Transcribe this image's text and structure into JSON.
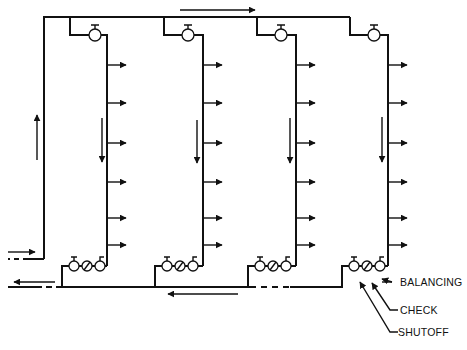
{
  "diagram": {
    "type": "hydronic-reverse-return-riser-schematic",
    "colors": {
      "line": "#111111",
      "background": "#ffffff"
    },
    "supply_header": {
      "y": 17,
      "x_start": 44,
      "x_end": 350
    },
    "left_supply_riser": {
      "x": 44,
      "y_top": 17,
      "y_bottom": 259
    },
    "return_header": {
      "y": 287,
      "x_start": 22,
      "x_end": 345
    },
    "risers": [
      {
        "id": 1,
        "branch_x": 70,
        "riser_x": 107,
        "top_valve_x": 95
      },
      {
        "id": 2,
        "branch_x": 164,
        "riser_x": 203,
        "top_valve_x": 188
      },
      {
        "id": 3,
        "branch_x": 257,
        "riser_x": 296,
        "top_valve_x": 281
      },
      {
        "id": 4,
        "branch_x": 350,
        "riser_x": 388,
        "top_valve_x": 374
      }
    ],
    "terminal_branch_ys": [
      65,
      103,
      143,
      182,
      218,
      245
    ],
    "valve_assemblies": [
      {
        "riser": 1,
        "y": 266,
        "branch_x": 62
      },
      {
        "riser": 2,
        "y": 266,
        "branch_x": 155
      },
      {
        "riser": 3,
        "y": 266,
        "branch_x": 248
      },
      {
        "riser": 4,
        "y": 266,
        "branch_x": 342
      }
    ],
    "flow_arrows": [
      {
        "name": "supply-header-flow",
        "direction": "right"
      },
      {
        "name": "left-riser-flow",
        "direction": "up"
      },
      {
        "name": "riser-downflow",
        "direction": "down"
      },
      {
        "name": "inlet-flow",
        "direction": "right"
      },
      {
        "name": "outlet-flow",
        "direction": "left"
      },
      {
        "name": "return-header-flow",
        "direction": "left"
      }
    ],
    "labels": {
      "balancing": "BALANCING",
      "check": "CHECK",
      "shutoff": "SHUTOFF"
    }
  }
}
